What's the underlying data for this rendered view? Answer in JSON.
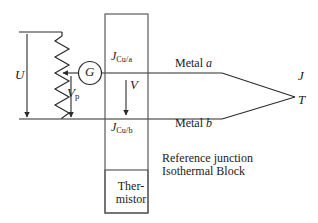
{
  "figure": {
    "line_color": "#2b2b2b",
    "text_color": "#1a1a1a",
    "background": "#ffffff"
  },
  "labels": {
    "u": "U",
    "vp_main": "V",
    "vp_sub": "p",
    "v": "V",
    "current_a_main": "J",
    "current_a_sub": "Cu/a",
    "current_b_main": "J",
    "current_b_sub": "Cu/b",
    "metal_a": "Metal a",
    "metal_a_name": "Metal",
    "metal_a_symbol": "a",
    "metal_b_name": "Metal",
    "metal_b_symbol": "b",
    "junction_current": "J",
    "junction_temperature": "T",
    "reference_line1": "Reference junction",
    "reference_line2": "Isothermal Block",
    "thermistor_line1": "Ther-",
    "thermistor_line2": "mistor"
  },
  "components": {
    "galvanometer_symbol": "G",
    "resistor_type": "zigzag-resistor",
    "isothermal_block": "rectangle",
    "thermistor_block": "rectangle"
  }
}
